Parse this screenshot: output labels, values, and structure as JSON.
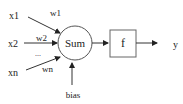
{
  "diagram": {
    "inputs": [
      {
        "label": "x1",
        "weight": "w1"
      },
      {
        "label": "x2",
        "weight": "w2"
      },
      {
        "label": "xn",
        "weight": "wn"
      }
    ],
    "ellipsis": "...",
    "sum_label": "Sum",
    "bias_label": "bias",
    "activation_label": "f",
    "output_label": "y",
    "colors": {
      "stroke": "#333333",
      "text": "#222222",
      "background": "#ffffff"
    }
  }
}
